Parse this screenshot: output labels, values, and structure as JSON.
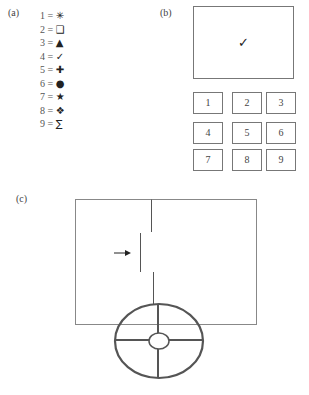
{
  "panels": {
    "a": {
      "label": "(a)"
    },
    "b": {
      "label": "(b)"
    },
    "c": {
      "label": "(c)"
    }
  },
  "legend": [
    {
      "number": "1",
      "eq": "=",
      "symbol": "✳",
      "icon": "asterisk-icon"
    },
    {
      "number": "2",
      "eq": "=",
      "symbol": "❑",
      "icon": "shadowed-square-icon"
    },
    {
      "number": "3",
      "eq": "=",
      "symbol": "▲",
      "icon": "triangle-icon"
    },
    {
      "number": "4",
      "eq": "=",
      "symbol": "✓",
      "icon": "checkmark-icon"
    },
    {
      "number": "5",
      "eq": "=",
      "symbol": "✚",
      "icon": "cross-icon"
    },
    {
      "number": "6",
      "eq": "=",
      "symbol": "●",
      "icon": "circle-icon"
    },
    {
      "number": "7",
      "eq": "=",
      "symbol": "★",
      "icon": "star-icon"
    },
    {
      "number": "8",
      "eq": "=",
      "symbol": "❖",
      "icon": "diamond-cross-icon"
    },
    {
      "number": "9",
      "eq": "=",
      "symbol": "∑",
      "icon": "sigma-icon"
    }
  ],
  "display": {
    "symbol": "✓"
  },
  "keypad": [
    "1",
    "2",
    "3",
    "4",
    "5",
    "6",
    "7",
    "8",
    "9"
  ],
  "circuit": {
    "arrow": "→"
  }
}
